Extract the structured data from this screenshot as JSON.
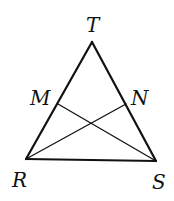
{
  "diagram": {
    "type": "triangle-with-cevians",
    "stroke_color": "#111111",
    "background_color": "#ffffff",
    "vertices": {
      "T": {
        "x": 92,
        "y": 42
      },
      "R": {
        "x": 26,
        "y": 159
      },
      "S": {
        "x": 156,
        "y": 161
      },
      "M": {
        "x": 58,
        "y": 104
      },
      "N": {
        "x": 126,
        "y": 104
      }
    },
    "labels": {
      "T": {
        "text": "T",
        "x": 86,
        "y": 32
      },
      "M": {
        "text": "M",
        "x": 30,
        "y": 105
      },
      "N": {
        "text": "N",
        "x": 131,
        "y": 105
      },
      "R": {
        "text": "R",
        "x": 12,
        "y": 187
      },
      "S": {
        "text": "S",
        "x": 152,
        "y": 189
      }
    },
    "segments": [
      {
        "from": "T",
        "to": "R",
        "kind": "side"
      },
      {
        "from": "T",
        "to": "S",
        "kind": "side"
      },
      {
        "from": "R",
        "to": "S",
        "kind": "side"
      },
      {
        "from": "M",
        "to": "S",
        "kind": "cevian"
      },
      {
        "from": "N",
        "to": "R",
        "kind": "cevian"
      }
    ]
  }
}
